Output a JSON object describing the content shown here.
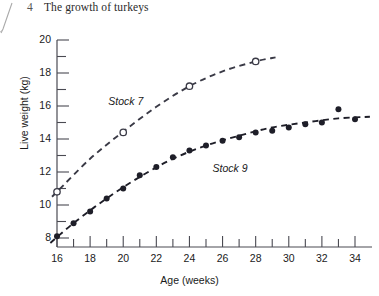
{
  "figure": {
    "number": "4",
    "title": "The growth of turkeys"
  },
  "chart_data": {
    "type": "scatter",
    "title": "The growth of turkeys",
    "xlabel": "Age (weeks)",
    "ylabel": "Live weight (kg)",
    "xlim": [
      15.2,
      34.8
    ],
    "ylim": [
      7.2,
      20.0
    ],
    "xticks": [
      16,
      17,
      18,
      19,
      20,
      21,
      22,
      23,
      24,
      25,
      26,
      27,
      28,
      29,
      30,
      31,
      32,
      33,
      34
    ],
    "xtick_labels": [
      "16",
      "",
      "18",
      "",
      "20",
      "",
      "22",
      "",
      "24",
      "",
      "26",
      "",
      "28",
      "",
      "30",
      "",
      "32",
      "",
      "34"
    ],
    "yticks": [
      8,
      9,
      10,
      11,
      12,
      13,
      14,
      15,
      16,
      17,
      18,
      19,
      20
    ],
    "ytick_labels": [
      "8",
      "",
      "10",
      "",
      "12",
      "",
      "14",
      "",
      "16",
      "",
      "18",
      "",
      "20"
    ],
    "grid": false,
    "legend": "inline-annotations",
    "series": [
      {
        "name": "Stock 7",
        "marker": "open-circle",
        "line": "dashed",
        "color": "#3a3a46",
        "points": [
          {
            "x": 16,
            "y": 10.8
          },
          {
            "x": 20,
            "y": 14.4
          },
          {
            "x": 24,
            "y": 17.2
          },
          {
            "x": 28,
            "y": 18.7
          }
        ]
      },
      {
        "name": "Stock 9",
        "marker": "filled-circle",
        "line": "dashed",
        "color": "#1e1e28",
        "points": [
          {
            "x": 16,
            "y": 8.1
          },
          {
            "x": 17,
            "y": 8.9
          },
          {
            "x": 18,
            "y": 9.6
          },
          {
            "x": 19,
            "y": 10.4
          },
          {
            "x": 20,
            "y": 11.0
          },
          {
            "x": 21,
            "y": 11.8
          },
          {
            "x": 22,
            "y": 12.3
          },
          {
            "x": 23,
            "y": 12.9
          },
          {
            "x": 24,
            "y": 13.3
          },
          {
            "x": 25,
            "y": 13.6
          },
          {
            "x": 26,
            "y": 13.9
          },
          {
            "x": 27,
            "y": 14.1
          },
          {
            "x": 28,
            "y": 14.4
          },
          {
            "x": 29,
            "y": 14.5
          },
          {
            "x": 30,
            "y": 14.7
          },
          {
            "x": 31,
            "y": 14.9
          },
          {
            "x": 32,
            "y": 15.0
          },
          {
            "x": 33,
            "y": 15.8
          },
          {
            "x": 34,
            "y": 15.2
          }
        ]
      }
    ],
    "annotations": [
      {
        "text": "Stock 7",
        "x": 19.1,
        "y": 16.2
      },
      {
        "text": "Stock 9",
        "x": 25.4,
        "y": 12.1
      }
    ]
  }
}
